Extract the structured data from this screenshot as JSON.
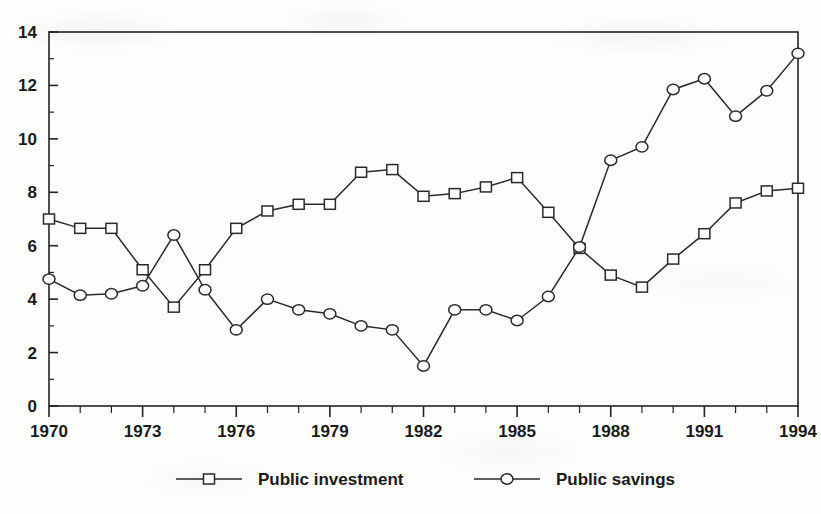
{
  "chart_data": {
    "type": "line",
    "title": "",
    "subtitle": "",
    "xlabel": "",
    "ylabel": "",
    "xlim": [
      1970,
      1994
    ],
    "ylim": [
      0,
      14
    ],
    "grid": false,
    "legend_position": "bottom",
    "x": [
      1970,
      1971,
      1972,
      1973,
      1974,
      1975,
      1976,
      1977,
      1978,
      1979,
      1980,
      1981,
      1982,
      1983,
      1984,
      1985,
      1986,
      1987,
      1988,
      1989,
      1990,
      1991,
      1992,
      1993,
      1994
    ],
    "categories": [
      "1970",
      "1971",
      "1972",
      "1973",
      "1974",
      "1975",
      "1976",
      "1977",
      "1978",
      "1979",
      "1980",
      "1981",
      "1982",
      "1983",
      "1984",
      "1985",
      "1986",
      "1987",
      "1988",
      "1989",
      "1990",
      "1991",
      "1992",
      "1993",
      "1994"
    ],
    "series": [
      {
        "name": "Public investment",
        "marker": "square",
        "values": [
          7.0,
          6.65,
          6.65,
          5.1,
          3.7,
          5.1,
          6.65,
          7.3,
          7.55,
          7.55,
          8.75,
          8.85,
          7.85,
          7.95,
          8.2,
          8.55,
          7.25,
          5.9,
          4.9,
          4.45,
          5.5,
          6.45,
          7.6,
          8.05,
          8.15
        ]
      },
      {
        "name": "Public savings",
        "marker": "circle",
        "values": [
          4.75,
          4.15,
          4.2,
          4.5,
          6.4,
          4.35,
          2.85,
          4.0,
          3.6,
          3.45,
          3.0,
          2.85,
          1.5,
          3.6,
          3.6,
          3.2,
          4.1,
          5.95,
          9.2,
          9.7,
          11.85,
          12.25,
          10.85,
          11.8,
          13.2
        ]
      }
    ],
    "y_axis": {
      "ticks": [
        0,
        2,
        4,
        6,
        8,
        10,
        12,
        14
      ],
      "tick_labels": [
        "0",
        "2",
        "4",
        "6",
        "8",
        "10",
        "12",
        "14"
      ],
      "minor_ticks": [
        1,
        3,
        5,
        7,
        9,
        11,
        13
      ]
    },
    "x_axis": {
      "ticks": [
        1970,
        1973,
        1976,
        1979,
        1982,
        1985,
        1988,
        1991,
        1994
      ],
      "tick_labels": [
        "1970",
        "1973",
        "1976",
        "1979",
        "1982",
        "1985",
        "1988",
        "1991",
        "1994"
      ],
      "minor_ticks": [
        1971,
        1972,
        1974,
        1975,
        1977,
        1978,
        1980,
        1981,
        1983,
        1984,
        1986,
        1987,
        1989,
        1990,
        1992,
        1993
      ]
    },
    "colors": {
      "line": "#2a2a2a",
      "axis": "#232323",
      "marker_fill": "#ffffff",
      "background": "#fdfdfc"
    }
  },
  "legend": {
    "entries": [
      {
        "label": "Public investment",
        "marker": "square-marker"
      },
      {
        "label": "Public savings",
        "marker": "circle-marker"
      }
    ]
  }
}
